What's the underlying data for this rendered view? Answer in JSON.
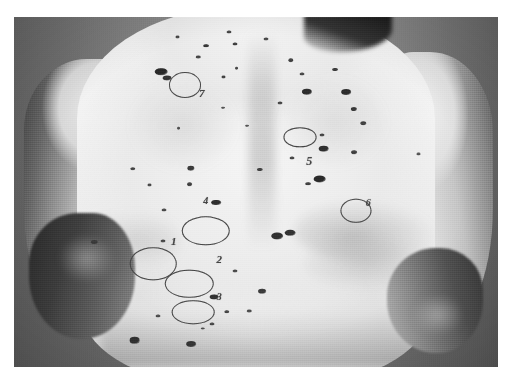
{
  "image": {
    "kind": "clinical-photograph",
    "modality": "grayscale print photograph",
    "subject": "posterior trunk (back) of adult patient",
    "view": "posterior",
    "plate_left": 14,
    "plate_top": 17,
    "plate_width": 484,
    "plate_height": 350,
    "page_background": "#ffffff",
    "backdrop_color": "#848484",
    "skin_color": "#efece6",
    "marker_color": "#4b4843",
    "nevus_color": "#3b3733",
    "caption": ""
  },
  "annotations": {
    "description": "Seven pigmented lesions ringed with surgical marker and numbered",
    "count": 7,
    "marked_lesions": [
      {
        "id": "1",
        "label": "1",
        "ring_x": 28.8,
        "ring_y": 70.5,
        "ring_w": 9.2,
        "ring_h": 9.0,
        "label_x": 33.0,
        "label_y": 64.0,
        "font": 11
      },
      {
        "id": "2",
        "label": "2",
        "ring_x": 36.2,
        "ring_y": 76.2,
        "ring_w": 9.6,
        "ring_h": 7.6,
        "label_x": 42.4,
        "label_y": 69.2,
        "font": 11
      },
      {
        "id": "3",
        "label": "3",
        "ring_x": 37.0,
        "ring_y": 84.4,
        "ring_w": 8.4,
        "ring_h": 6.2,
        "label_x": 42.4,
        "label_y": 80.0,
        "font": 10
      },
      {
        "id": "4",
        "label": "4",
        "ring_x": 39.6,
        "ring_y": 61.0,
        "ring_w": 9.6,
        "ring_h": 7.8,
        "label_x": 39.6,
        "label_y": 52.6,
        "font": 10
      },
      {
        "id": "5",
        "label": "5",
        "ring_x": 59.0,
        "ring_y": 34.4,
        "ring_w": 6.4,
        "ring_h": 5.0,
        "label_x": 61.0,
        "label_y": 41.2,
        "font": 12
      },
      {
        "id": "6",
        "label": "6",
        "ring_x": 70.6,
        "ring_y": 55.4,
        "ring_w": 6.0,
        "ring_h": 6.4,
        "label_x": 73.2,
        "label_y": 53.0,
        "font": 10
      },
      {
        "id": "7",
        "label": "7",
        "ring_x": 35.4,
        "ring_y": 19.4,
        "ring_w": 6.2,
        "ring_h": 6.8,
        "label_x": 38.8,
        "label_y": 21.6,
        "font": 11
      }
    ]
  },
  "lesions": {
    "description": "Multiple melanocytic nevi scattered over the back and shoulders",
    "spots": [
      {
        "x": 30.4,
        "y": 15.6,
        "w": 2.6,
        "h": 2.2,
        "tone": "#2e2b27"
      },
      {
        "x": 31.6,
        "y": 17.4,
        "w": 1.8,
        "h": 1.5,
        "tone": "#3a3733"
      },
      {
        "x": 39.7,
        "y": 8.2,
        "w": 1.2,
        "h": 1.0,
        "tone": "#3b3833"
      },
      {
        "x": 45.6,
        "y": 7.6,
        "w": 1.0,
        "h": 0.9,
        "tone": "#44413c"
      },
      {
        "x": 38.1,
        "y": 11.4,
        "w": 0.9,
        "h": 0.8,
        "tone": "#4a4742"
      },
      {
        "x": 43.3,
        "y": 17.0,
        "w": 1.0,
        "h": 0.9,
        "tone": "#47443f"
      },
      {
        "x": 46.0,
        "y": 14.7,
        "w": 0.8,
        "h": 0.7,
        "tone": "#4e4b46"
      },
      {
        "x": 34.0,
        "y": 31.8,
        "w": 0.8,
        "h": 0.7,
        "tone": "#55524d"
      },
      {
        "x": 24.6,
        "y": 43.4,
        "w": 1.1,
        "h": 1.0,
        "tone": "#4a4742"
      },
      {
        "x": 28.0,
        "y": 48.0,
        "w": 1.0,
        "h": 0.9,
        "tone": "#4d4a45"
      },
      {
        "x": 36.6,
        "y": 43.2,
        "w": 1.5,
        "h": 1.3,
        "tone": "#403d38"
      },
      {
        "x": 31.0,
        "y": 55.2,
        "w": 1.0,
        "h": 0.9,
        "tone": "#4f4c47"
      },
      {
        "x": 30.8,
        "y": 64.0,
        "w": 1.0,
        "h": 0.9,
        "tone": "#4d4a45"
      },
      {
        "x": 41.8,
        "y": 53.0,
        "w": 2.0,
        "h": 1.7,
        "tone": "#33302c"
      },
      {
        "x": 36.3,
        "y": 47.8,
        "w": 1.2,
        "h": 1.0,
        "tone": "#46433e"
      },
      {
        "x": 29.8,
        "y": 85.4,
        "w": 1.0,
        "h": 0.9,
        "tone": "#524f4a"
      },
      {
        "x": 24.9,
        "y": 92.4,
        "w": 2.2,
        "h": 1.8,
        "tone": "#37342f"
      },
      {
        "x": 36.6,
        "y": 93.4,
        "w": 2.0,
        "h": 1.7,
        "tone": "#3b3833"
      },
      {
        "x": 41.0,
        "y": 87.8,
        "w": 1.0,
        "h": 0.9,
        "tone": "#4d4a45"
      },
      {
        "x": 44.0,
        "y": 84.2,
        "w": 1.1,
        "h": 1.0,
        "tone": "#4a4742"
      },
      {
        "x": 48.6,
        "y": 84.0,
        "w": 0.9,
        "h": 0.8,
        "tone": "#524f4a"
      },
      {
        "x": 51.2,
        "y": 78.4,
        "w": 1.6,
        "h": 1.3,
        "tone": "#413e39"
      },
      {
        "x": 54.4,
        "y": 62.6,
        "w": 2.4,
        "h": 2.0,
        "tone": "#35322e"
      },
      {
        "x": 50.8,
        "y": 43.6,
        "w": 1.3,
        "h": 1.1,
        "tone": "#44413c"
      },
      {
        "x": 55.0,
        "y": 24.6,
        "w": 1.0,
        "h": 0.9,
        "tone": "#4b4843"
      },
      {
        "x": 57.2,
        "y": 12.4,
        "w": 1.1,
        "h": 1.0,
        "tone": "#474440"
      },
      {
        "x": 59.6,
        "y": 16.2,
        "w": 1.0,
        "h": 0.9,
        "tone": "#4c4944"
      },
      {
        "x": 60.6,
        "y": 21.4,
        "w": 2.1,
        "h": 1.8,
        "tone": "#332f2b"
      },
      {
        "x": 66.4,
        "y": 15.0,
        "w": 1.2,
        "h": 1.1,
        "tone": "#403d38"
      },
      {
        "x": 68.6,
        "y": 21.4,
        "w": 2.0,
        "h": 1.7,
        "tone": "#322f2b"
      },
      {
        "x": 70.2,
        "y": 26.4,
        "w": 1.3,
        "h": 1.1,
        "tone": "#3e3b36"
      },
      {
        "x": 64.0,
        "y": 37.6,
        "w": 2.2,
        "h": 1.9,
        "tone": "#34312d"
      },
      {
        "x": 70.2,
        "y": 38.6,
        "w": 1.2,
        "h": 1.0,
        "tone": "#45423d"
      },
      {
        "x": 63.2,
        "y": 46.4,
        "w": 2.6,
        "h": 2.0,
        "tone": "#2f2c28"
      },
      {
        "x": 60.8,
        "y": 47.6,
        "w": 1.2,
        "h": 1.0,
        "tone": "#45423d"
      },
      {
        "x": 57.4,
        "y": 40.2,
        "w": 1.0,
        "h": 0.9,
        "tone": "#4b4843"
      },
      {
        "x": 63.7,
        "y": 33.8,
        "w": 1.0,
        "h": 0.9,
        "tone": "#4a4742"
      },
      {
        "x": 57.0,
        "y": 61.6,
        "w": 2.2,
        "h": 1.8,
        "tone": "#38352f"
      },
      {
        "x": 72.2,
        "y": 30.4,
        "w": 1.1,
        "h": 1.0,
        "tone": "#474440"
      },
      {
        "x": 83.6,
        "y": 39.0,
        "w": 1.0,
        "h": 0.9,
        "tone": "#5a5752"
      },
      {
        "x": 16.6,
        "y": 64.4,
        "w": 1.3,
        "h": 1.1,
        "tone": "#3f3c37"
      },
      {
        "x": 43.2,
        "y": 26.0,
        "w": 0.8,
        "h": 0.7,
        "tone": "#55524d"
      },
      {
        "x": 48.2,
        "y": 31.0,
        "w": 0.8,
        "h": 0.7,
        "tone": "#56534e"
      },
      {
        "x": 33.8,
        "y": 5.8,
        "w": 1.0,
        "h": 0.9,
        "tone": "#4c4944"
      },
      {
        "x": 44.4,
        "y": 4.2,
        "w": 1.0,
        "h": 0.9,
        "tone": "#4a4742"
      },
      {
        "x": 52.0,
        "y": 6.2,
        "w": 1.0,
        "h": 0.9,
        "tone": "#4e4b46"
      },
      {
        "x": 39.0,
        "y": 89.0,
        "w": 0.9,
        "h": 0.8,
        "tone": "#535049"
      },
      {
        "x": 45.6,
        "y": 72.6,
        "w": 1.0,
        "h": 0.9,
        "tone": "#4e4b46"
      },
      {
        "x": 41.3,
        "y": 80.0,
        "w": 1.8,
        "h": 1.4,
        "tone": "#363330"
      }
    ]
  }
}
